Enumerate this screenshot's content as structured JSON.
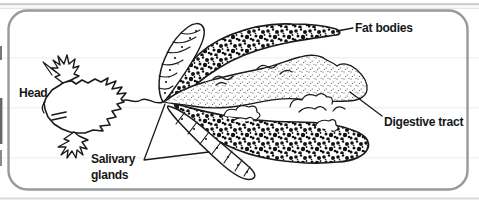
{
  "diagram": {
    "labels": {
      "head": "Head",
      "fat_bodies": "Fat bodies",
      "digestive_tract": "Digestive tract",
      "salivary_glands": "Salivary glands"
    },
    "colors": {
      "background": "#ffffff",
      "ink": "#1a1a1a",
      "panel_border": "#98999b",
      "speckle_ink": "#111111",
      "stipple_ink": "#333333"
    }
  }
}
